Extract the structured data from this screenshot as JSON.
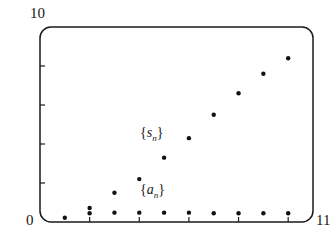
{
  "figure": {
    "name": "sequence-and-partial-sums-scatter",
    "background_color": "#ffffff",
    "ink_color": "#1a1a1a"
  },
  "axes": {
    "y_max_label": "10",
    "origin_label": "0",
    "x_max_label": "11",
    "frame": {
      "left": 40,
      "top": 27,
      "right": 313,
      "bottom": 222,
      "corner_radius": 11
    },
    "y_ticks": [
      2,
      4,
      6,
      8
    ],
    "x_ticks": [
      2,
      4,
      6,
      8,
      10
    ]
  },
  "annotations": {
    "sn": {
      "open": "{",
      "var": "s",
      "sub": "n",
      "close": "}"
    },
    "an": {
      "open": "{",
      "var": "a",
      "sub": "n",
      "close": "}"
    }
  },
  "chart_data": {
    "type": "scatter",
    "title": "",
    "xlabel": "",
    "ylabel": "",
    "xlim": [
      0,
      11
    ],
    "ylim": [
      0,
      10
    ],
    "grid": false,
    "legend": "inline-annotations",
    "x_ticks": [
      2,
      4,
      6,
      8,
      10
    ],
    "y_ticks": [
      2,
      4,
      6,
      8
    ],
    "x_tick_labels": [
      "0",
      "11"
    ],
    "y_tick_labels": [
      "0",
      "10"
    ],
    "marker": "filled-circle",
    "marker_color": "#121212",
    "marker_size_px": 3.2,
    "series": [
      {
        "name": "{a_n}",
        "label_position": {
          "x": 5.1,
          "y": 1.05
        },
        "x": [
          1,
          2,
          2,
          3,
          4,
          5,
          6,
          7,
          8,
          9,
          10
        ],
        "values": [
          0.22,
          0.72,
          0.45,
          0.48,
          0.48,
          0.48,
          0.48,
          0.45,
          0.45,
          0.45,
          0.45
        ],
        "points": [
          {
            "n": 1,
            "x": 1,
            "y": 0.22
          },
          {
            "n": 2,
            "x": 2,
            "y": 0.72
          },
          {
            "n": 2,
            "x": 2,
            "y": 0.45
          },
          {
            "n": 3,
            "x": 3,
            "y": 0.48
          },
          {
            "n": 4,
            "x": 4,
            "y": 0.48
          },
          {
            "n": 5,
            "x": 5,
            "y": 0.48
          },
          {
            "n": 6,
            "x": 6,
            "y": 0.48
          },
          {
            "n": 7,
            "x": 7,
            "y": 0.45
          },
          {
            "n": 8,
            "x": 8,
            "y": 0.45
          },
          {
            "n": 9,
            "x": 9,
            "y": 0.45
          },
          {
            "n": 10,
            "x": 10,
            "y": 0.45
          }
        ]
      },
      {
        "name": "{s_n}",
        "label_position": {
          "x": 5.1,
          "y": 3.95
        },
        "x": [
          3,
          4,
          5,
          6,
          7,
          8,
          9,
          10
        ],
        "values": [
          1.5,
          2.2,
          3.3,
          4.3,
          5.5,
          6.6,
          7.6,
          8.4
        ],
        "points": [
          {
            "n": 3,
            "x": 3,
            "y": 1.5
          },
          {
            "n": 4,
            "x": 4,
            "y": 2.2
          },
          {
            "n": 5,
            "x": 5,
            "y": 3.3
          },
          {
            "n": 6,
            "x": 6,
            "y": 4.3
          },
          {
            "n": 7,
            "x": 7,
            "y": 5.5
          },
          {
            "n": 8,
            "x": 8,
            "y": 6.6
          },
          {
            "n": 9,
            "x": 9,
            "y": 7.6
          },
          {
            "n": 10,
            "x": 10,
            "y": 8.4
          }
        ]
      }
    ]
  }
}
